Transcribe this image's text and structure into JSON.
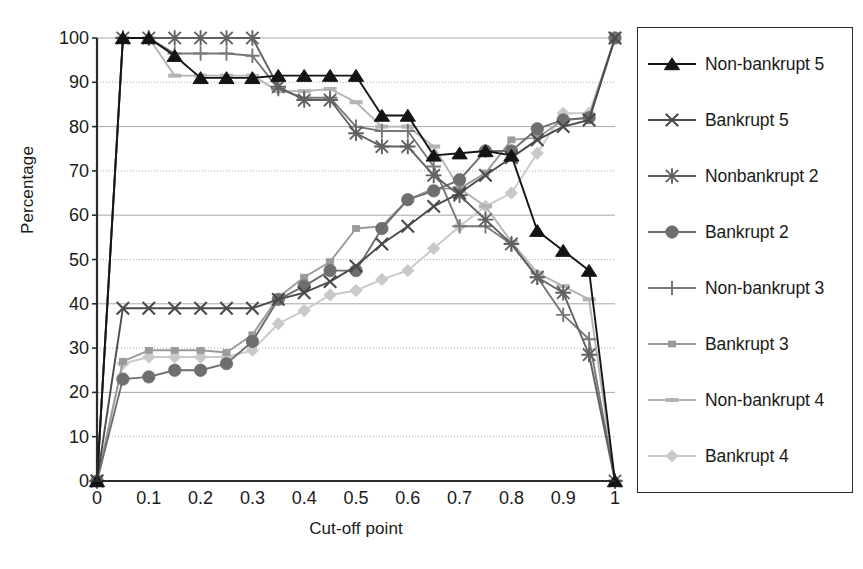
{
  "chart_data": {
    "type": "line",
    "title": "",
    "xlabel": "Cut-off point",
    "ylabel": "Percentage",
    "xlim": [
      0,
      1
    ],
    "ylim": [
      0,
      100
    ],
    "xticks": [
      "0",
      "0.1",
      "0.2",
      "0.3",
      "0.4",
      "0.5",
      "0.6",
      "0.7",
      "0.8",
      "0.9",
      "1"
    ],
    "yticks": [
      "0",
      "10",
      "20",
      "30",
      "40",
      "50",
      "60",
      "70",
      "80",
      "90",
      "100"
    ],
    "grid": "horizontal",
    "legend_position": "right-outside",
    "x": [
      0,
      0.05,
      0.1,
      0.15,
      0.2,
      0.25,
      0.3,
      0.35,
      0.4,
      0.45,
      0.5,
      0.55,
      0.6,
      0.65,
      0.7,
      0.75,
      0.8,
      0.85,
      0.9,
      0.95,
      1
    ],
    "series": [
      {
        "name": "Non-bankrupt 5",
        "marker": "triangle",
        "color": "#141414",
        "values": [
          0,
          100,
          100,
          96,
          91,
          91,
          91,
          91.5,
          91.5,
          91.5,
          91.5,
          82.5,
          82.5,
          73.5,
          74,
          74.5,
          73.5,
          56.5,
          52,
          47.5,
          0
        ]
      },
      {
        "name": "Bankrupt 5",
        "marker": "cross",
        "color": "#4a4a4a",
        "values": [
          0,
          39,
          39,
          39,
          39,
          39,
          39,
          41,
          42.5,
          45,
          48.5,
          53.5,
          57.5,
          62,
          65,
          69,
          73,
          77,
          80,
          81.5,
          100
        ]
      },
      {
        "name": "Nonbankrupt 2",
        "marker": "star",
        "color": "#616161",
        "values": [
          0,
          100,
          100,
          100,
          100,
          100,
          100,
          89,
          86,
          86,
          78.5,
          75.5,
          75.5,
          69,
          64.5,
          59,
          53.5,
          46,
          42.5,
          28.5,
          0
        ]
      },
      {
        "name": "Bankrupt 2",
        "marker": "circle",
        "color": "#6e6e6e",
        "values": [
          0,
          23,
          23.5,
          25,
          25,
          26.5,
          31.5,
          41,
          44,
          47.5,
          47.5,
          57,
          63.5,
          65.5,
          68,
          74.5,
          74.5,
          79.5,
          81.5,
          82,
          100
        ]
      },
      {
        "name": "Non-bankrupt 3",
        "marker": "plus",
        "color": "#787878",
        "values": [
          0,
          100,
          100,
          96.5,
          96.5,
          96.5,
          96,
          88.5,
          86.5,
          86.5,
          80,
          79,
          79,
          71,
          57.5,
          57.5,
          53.5,
          46,
          37.5,
          32,
          0
        ]
      },
      {
        "name": "Bankrupt 3",
        "marker": "square",
        "color": "#9a9a9a",
        "values": [
          0,
          27,
          29.5,
          29.5,
          29.5,
          29,
          33,
          41.5,
          46,
          49.5,
          57,
          57.5,
          63.5,
          66,
          66,
          69.5,
          77,
          77.5,
          81.5,
          82,
          100
        ]
      },
      {
        "name": "Non-bankrupt 4",
        "marker": "dash",
        "color": "#b4b4b4",
        "values": [
          0,
          100,
          100,
          91.5,
          91.5,
          91.5,
          91.5,
          88,
          88,
          88.5,
          85.5,
          80,
          80,
          75.5,
          66,
          62,
          54,
          47,
          44,
          41,
          0
        ]
      },
      {
        "name": "Bankrupt 4",
        "marker": "diamond",
        "color": "#c9c9c9",
        "values": [
          0,
          26.5,
          28,
          28,
          28,
          28,
          29.5,
          35.5,
          38.5,
          42,
          43,
          45.5,
          47.5,
          52.5,
          57.5,
          62,
          65,
          74,
          83,
          83,
          100
        ]
      }
    ]
  },
  "legend": {
    "items": [
      {
        "label": "Non-bankrupt 5",
        "marker": "triangle",
        "color": "#141414"
      },
      {
        "label": "Bankrupt 5",
        "marker": "cross",
        "color": "#4a4a4a"
      },
      {
        "label": "Nonbankrupt 2",
        "marker": "star",
        "color": "#616161"
      },
      {
        "label": "Bankrupt 2",
        "marker": "circle",
        "color": "#6e6e6e"
      },
      {
        "label": "Non-bankrupt 3",
        "marker": "plus",
        "color": "#787878"
      },
      {
        "label": "Bankrupt 3",
        "marker": "square",
        "color": "#9a9a9a"
      },
      {
        "label": "Non-bankrupt 4",
        "marker": "dash",
        "color": "#b4b4b4"
      },
      {
        "label": "Bankrupt 4",
        "marker": "diamond",
        "color": "#c9c9c9"
      }
    ]
  },
  "axes": {
    "gridline_color": "#9f9f9f",
    "axis_color": "#2b2b2b",
    "background": "#ffffff"
  }
}
